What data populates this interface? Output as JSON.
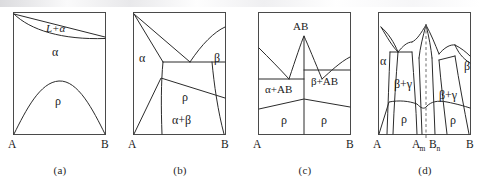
{
  "figure": {
    "kind": "phase-diagram-set",
    "panel_count": 4,
    "noise_band": "scan-artifact"
  },
  "panels": [
    {
      "id": "a",
      "caption": "(a)",
      "axis": {
        "left": "A",
        "right": "B"
      },
      "regions": [
        {
          "name": "liquid-plus-alpha",
          "label": "L+α"
        },
        {
          "name": "alpha",
          "label": "α"
        },
        {
          "name": "rho",
          "label": "ρ"
        }
      ]
    },
    {
      "id": "b",
      "caption": "(b)",
      "axis": {
        "left": "A",
        "right": "B"
      },
      "regions": [
        {
          "name": "alpha",
          "label": "α"
        },
        {
          "name": "beta",
          "label": "β"
        },
        {
          "name": "rho",
          "label": "ρ"
        },
        {
          "name": "alpha-plus-beta",
          "label": "α+β"
        }
      ]
    },
    {
      "id": "c",
      "caption": "(c)",
      "axis": {
        "left": "A",
        "right": "B"
      },
      "regions": [
        {
          "name": "compound-ab",
          "label": "AB"
        },
        {
          "name": "alpha-plus-ab",
          "label": "α+AB"
        },
        {
          "name": "beta-plus-ab",
          "label": "β+AB"
        },
        {
          "name": "rho-left",
          "label": "ρ"
        },
        {
          "name": "rho-right",
          "label": "ρ"
        }
      ]
    },
    {
      "id": "d",
      "caption": "(d)",
      "axis": {
        "left": "A",
        "right": "B",
        "inner_left_base": "A",
        "inner_left_sub": "m",
        "inner_right_base": "B",
        "inner_right_sub": "n"
      },
      "regions": [
        {
          "name": "alpha",
          "label": "α"
        },
        {
          "name": "beta",
          "label": "β"
        },
        {
          "name": "beta-plus-gamma-left",
          "label": "β+γ"
        },
        {
          "name": "beta-plus-gamma-right",
          "label": "β+γ"
        },
        {
          "name": "rho-left",
          "label": "ρ"
        },
        {
          "name": "rho-right",
          "label": "ρ"
        }
      ]
    }
  ],
  "colors": {
    "line": "#2b2b2b",
    "frame": "#4a4a4a",
    "dashed": "#6f6f6f",
    "text": "#1a1a1a",
    "background": "#ffffff"
  }
}
